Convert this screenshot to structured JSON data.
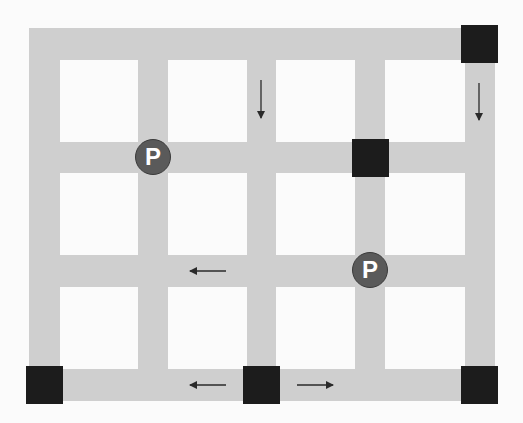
{
  "map": {
    "background": "#fbfbfb",
    "road_color": "#cfcfcf",
    "node_color": "#1c1c1c",
    "parking_color": "#5a5a5a",
    "vertical_roads_x": [
      [
        29,
        60
      ],
      [
        138,
        168
      ],
      [
        247,
        276
      ],
      [
        355,
        385
      ],
      [
        465,
        495
      ]
    ],
    "horizontal_roads_y": [
      [
        28,
        60
      ],
      [
        142,
        173
      ],
      [
        255,
        287
      ],
      [
        369,
        401
      ]
    ],
    "blocked_nodes": [
      {
        "x": 461,
        "y": 25
      },
      {
        "x": 352,
        "y": 139
      },
      {
        "x": 26,
        "y": 366
      },
      {
        "x": 243,
        "y": 366
      },
      {
        "x": 461,
        "y": 366
      }
    ],
    "parking": [
      {
        "label": "P",
        "cx": 153,
        "cy": 157
      },
      {
        "label": "P",
        "cx": 370,
        "cy": 270
      }
    ],
    "arrows": [
      {
        "dir": "down",
        "x1": 261,
        "y1": 80,
        "x2": 261,
        "y2": 118
      },
      {
        "dir": "down",
        "x1": 479,
        "y1": 83,
        "x2": 479,
        "y2": 120
      },
      {
        "dir": "left",
        "x1": 226,
        "y1": 271,
        "x2": 190,
        "y2": 271
      },
      {
        "dir": "left",
        "x1": 226,
        "y1": 385,
        "x2": 190,
        "y2": 385
      },
      {
        "dir": "right",
        "x1": 297,
        "y1": 385,
        "x2": 333,
        "y2": 385
      }
    ]
  }
}
